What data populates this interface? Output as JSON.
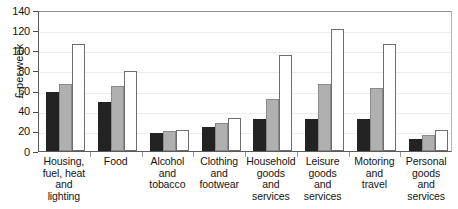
{
  "chart_data": {
    "type": "bar",
    "title": "",
    "subtitle": "",
    "xlabel": "",
    "ylabel": "£ per week",
    "ylim": [
      0,
      140
    ],
    "yticks": [
      0,
      20,
      40,
      60,
      80,
      100,
      120,
      140
    ],
    "ytick_labels": [
      "0",
      "20",
      "40",
      "60",
      "80",
      "100",
      "120",
      "140"
    ],
    "grid": true,
    "legend": "none",
    "categories": [
      "Housing, fuel, heat and lighting",
      "Food",
      "Alcohol and tobacco",
      "Clothing and footwear",
      "Household goods and services",
      "Leisure goods and services",
      "Motoring and travel",
      "Personal goods and services"
    ],
    "category_lines": [
      [
        "Housing,",
        "fuel, heat",
        "and",
        "lighting"
      ],
      [
        "Food"
      ],
      [
        "Alcohol",
        "and",
        "tobacco"
      ],
      [
        "Clothing",
        "and",
        "footwear"
      ],
      [
        "Household",
        "goods",
        "and",
        "services"
      ],
      [
        "Leisure",
        "goods",
        "and",
        "services"
      ],
      [
        "Motoring",
        "and",
        "travel"
      ],
      [
        "Personal",
        "goods",
        "and",
        "services"
      ]
    ],
    "series": [
      {
        "name": "series-1",
        "color": "#232323",
        "values": [
          59,
          49,
          18,
          24,
          32,
          32,
          32,
          12
        ]
      },
      {
        "name": "series-2",
        "color": "#b0b0b0",
        "values": [
          67,
          65,
          20,
          28,
          52,
          67,
          63,
          16
        ]
      },
      {
        "name": "series-3",
        "color": "#ffffff",
        "values": [
          106,
          79,
          21,
          33,
          95,
          121,
          106,
          21
        ]
      }
    ]
  },
  "top_caption": "",
  "axis": {
    "y_title": "£ per week"
  }
}
